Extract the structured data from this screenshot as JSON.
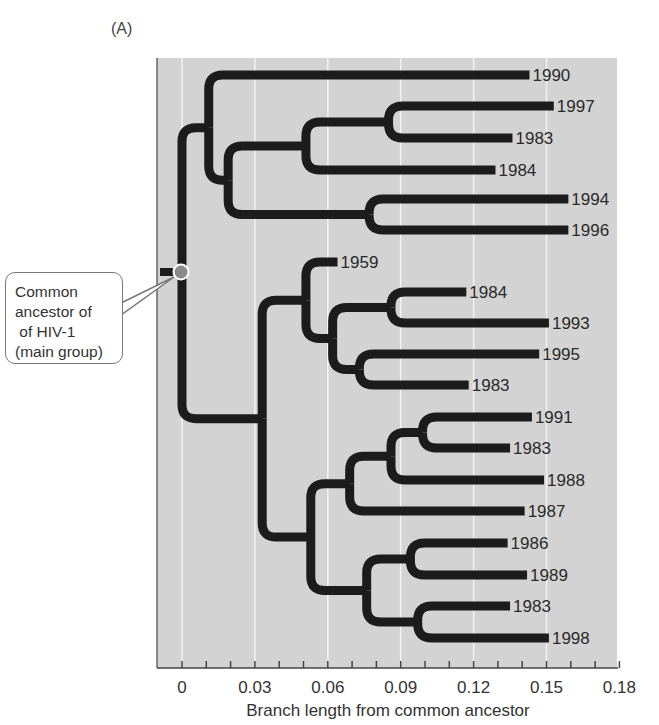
{
  "figure": {
    "panel_label": "(A)",
    "x_axis_title": "Branch length from common ancestor",
    "x_ticks": [
      "0",
      "0.03",
      "0.06",
      "0.09",
      "0.12",
      "0.15",
      "0.18"
    ],
    "x_tick_values": [
      0,
      0.03,
      0.06,
      0.09,
      0.12,
      0.15,
      0.18
    ],
    "minor_tick_step": 0.01,
    "x_range": [
      -0.01,
      0.18
    ],
    "background_color": "#d3d3d3",
    "gridline_color": "#f2f2f2",
    "branch_color": "#1c1c1c",
    "root_marker_color": "#8a8a8a"
  },
  "callout": {
    "lines": [
      "Common",
      "ancestor of",
      " of HIV-1",
      "(main group)"
    ]
  },
  "tree": {
    "root": {
      "x": 0.0,
      "label": "Common ancestor of HIV-1 (main group)"
    },
    "tips": [
      {
        "label": "1990",
        "branch_length": 0.143,
        "y": 75
      },
      {
        "label": "1997",
        "branch_length": 0.153,
        "y": 106
      },
      {
        "label": "1983",
        "branch_length": 0.136,
        "y": 138
      },
      {
        "label": "1984",
        "branch_length": 0.129,
        "y": 170
      },
      {
        "label": "1994",
        "branch_length": 0.159,
        "y": 199
      },
      {
        "label": "1996",
        "branch_length": 0.159,
        "y": 230
      },
      {
        "label": "1959",
        "branch_length": 0.064,
        "y": 262
      },
      {
        "label": "1984",
        "branch_length": 0.117,
        "y": 292
      },
      {
        "label": "1993",
        "branch_length": 0.151,
        "y": 323
      },
      {
        "label": "1995",
        "branch_length": 0.147,
        "y": 354
      },
      {
        "label": "1983",
        "branch_length": 0.118,
        "y": 385
      },
      {
        "label": "1991",
        "branch_length": 0.144,
        "y": 417
      },
      {
        "label": "1983",
        "branch_length": 0.135,
        "y": 448
      },
      {
        "label": "1988",
        "branch_length": 0.149,
        "y": 480
      },
      {
        "label": "1987",
        "branch_length": 0.141,
        "y": 511
      },
      {
        "label": "1986",
        "branch_length": 0.134,
        "y": 543
      },
      {
        "label": "1989",
        "branch_length": 0.142,
        "y": 575
      },
      {
        "label": "1983",
        "branch_length": 0.135,
        "y": 606
      },
      {
        "label": "1998",
        "branch_length": 0.151,
        "y": 638
      }
    ]
  }
}
